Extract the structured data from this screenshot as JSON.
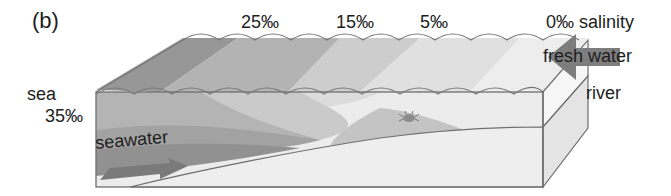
{
  "figure": {
    "panel_label": "(b)"
  },
  "salinity_labels": [
    {
      "text": "25‰",
      "x": 241
    },
    {
      "text": "15‰",
      "x": 336
    },
    {
      "text": "5‰",
      "x": 420
    },
    {
      "text": "0‰ salinity",
      "x": 546
    }
  ],
  "labels": {
    "sea": "sea",
    "sea_salinity": "35‰",
    "river": "river",
    "fresh_water": "fresh water",
    "seawater": "seawater"
  },
  "colors": {
    "band_35": "#8f8f8f",
    "band_25": "#a9a9a9",
    "band_15": "#c6c6c6",
    "band_5": "#dcdcdc",
    "band_0": "#ececec",
    "sediment": "#eeeeee",
    "outline": "#6f6f6f",
    "arrow_fresh": "#7d7d7d",
    "arrow_sea": "#7a7a7a"
  }
}
